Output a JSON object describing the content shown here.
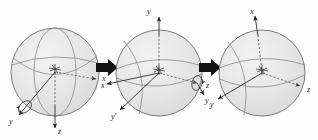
{
  "figure": {
    "caption": "",
    "background_color": "#fdfdfd",
    "ink_color": "#1a1a1a",
    "sphere_fill": "#e6e6e6",
    "sphere_stroke": "#6d6d6d",
    "arrow_color": "#111111",
    "panel_count": 3,
    "transition_count": 2
  },
  "panels": [
    {
      "id": "panel-1",
      "name": "initial-frame",
      "center": {
        "x": 55,
        "y": 72
      },
      "radius": 44,
      "axes": [
        {
          "name": "x-axis",
          "label": "x",
          "direction": "right-down",
          "style": "dashed",
          "label_x": 102,
          "label_y": 79
        },
        {
          "name": "y-axis",
          "label": "y",
          "direction": "lower-left",
          "style": "solid",
          "label_x": 10,
          "label_y": 122
        },
        {
          "name": "z-axis",
          "label": "z",
          "direction": "down",
          "style": "solid",
          "label_x": 58,
          "label_y": 133
        }
      ],
      "rotation_marker": {
        "about": "y",
        "label": "",
        "x": 20,
        "y": 106
      }
    },
    {
      "id": "panel-2",
      "name": "after-first-rotation",
      "center": {
        "x": 159,
        "y": 72
      },
      "radius": 44,
      "axes": [
        {
          "name": "y-axis",
          "label": "y",
          "direction": "up",
          "style": "solid",
          "label_x": 147,
          "label_y": 12
        },
        {
          "name": "x-axis",
          "label": "x",
          "direction": "left-down",
          "style": "solid",
          "label_x": 104,
          "label_y": 87
        },
        {
          "name": "z-axis",
          "label": "z",
          "direction": "right",
          "style": "dashed",
          "label_x": 207,
          "label_y": 89
        },
        {
          "name": "y-prime-axis",
          "label": "y'",
          "direction": "lower-left",
          "style": "solid",
          "label_x": 113,
          "label_y": 116
        },
        {
          "name": "y-lower-right-axis",
          "label": "y",
          "direction": "lower-right",
          "style": "solid",
          "label_x": 205,
          "label_y": 101
        }
      ],
      "rotation_marker": {
        "about": "z",
        "label": "",
        "x": 196,
        "y": 84
      }
    },
    {
      "id": "panel-3",
      "name": "after-second-rotation",
      "center": {
        "x": 262,
        "y": 72
      },
      "radius": 44,
      "axes": [
        {
          "name": "x-axis",
          "label": "x",
          "direction": "up",
          "style": "solid",
          "label_x": 250,
          "label_y": 12
        },
        {
          "name": "y-axis",
          "label": "y",
          "direction": "lower-left",
          "style": "solid",
          "label_x": 210,
          "label_y": 105
        },
        {
          "name": "z-axis",
          "label": "z",
          "direction": "lower-right",
          "style": "dashed",
          "label_x": 306,
          "label_y": 92
        }
      ],
      "rotation_marker": null
    }
  ],
  "transitions": [
    {
      "id": "arrow-1",
      "name": "transition-arrow-1",
      "label": "",
      "x": 96,
      "y": 67,
      "direction": "right"
    },
    {
      "id": "arrow-2",
      "name": "transition-arrow-2",
      "label": "",
      "x": 199,
      "y": 67,
      "direction": "right"
    }
  ]
}
